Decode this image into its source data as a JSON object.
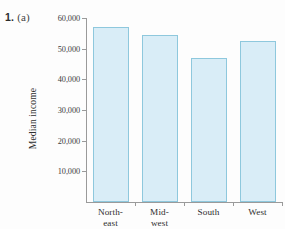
{
  "exercise": {
    "number": "1.",
    "part": "(a)"
  },
  "chart_data": {
    "type": "bar",
    "title": "",
    "xlabel": "",
    "ylabel": "Median income",
    "categories": [
      "North-east",
      "Mid-west",
      "South",
      "West"
    ],
    "category_lines": [
      [
        "North-",
        "east"
      ],
      [
        "Mid-",
        "west"
      ],
      [
        "South",
        ""
      ],
      [
        "West",
        ""
      ]
    ],
    "values": [
      57000,
      54500,
      47000,
      52500
    ],
    "ylim": [
      0,
      60000
    ],
    "ytick_values": [
      10000,
      20000,
      30000,
      40000,
      50000,
      60000
    ],
    "ytick_labels": [
      "10,000",
      "20,000",
      "30,000",
      "40,000",
      "50,000",
      "60,000"
    ],
    "grid": false,
    "legend": false,
    "bar_fill_color": "#d9edf7",
    "bar_border_color": "#8ec8dd",
    "axis_color": "#9a9a9a",
    "background_color": "#fdfdfd"
  }
}
